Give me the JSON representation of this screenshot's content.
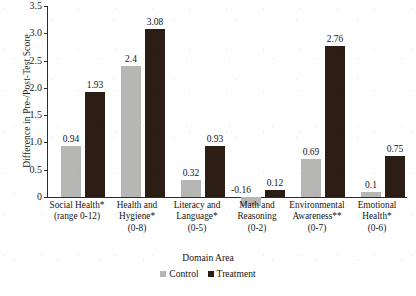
{
  "chart_data": {
    "type": "bar",
    "title": "",
    "xlabel": "Domain Area",
    "ylabel": "Difference in Pre-/Post-Test Score",
    "ylim": [
      -0.5,
      3.5
    ],
    "ytick_labels": [
      "3.5",
      "3.0",
      "2.5",
      "2.0",
      "1.5",
      "1.0",
      "0.5",
      "0"
    ],
    "ytick_values": [
      3.5,
      3.0,
      2.5,
      2.0,
      1.5,
      1.0,
      0.5,
      0
    ],
    "grid": false,
    "legend_position": "bottom-center",
    "categories": [
      "Social Health*\n(range 0-12)",
      "Health and\nHygiene*\n(0-8)",
      "Literacy and\nLanguage*\n(0-5)",
      "Math and\nReasoning\n(0-2)",
      "Environmental\nAwareness**\n(0-7)",
      "Emotional\nHealth*\n(0-6)"
    ],
    "category_lines": [
      [
        "Social Health*",
        "(range 0-12)"
      ],
      [
        "Health and",
        "Hygiene*",
        "(0-8)"
      ],
      [
        "Literacy and",
        "Language*",
        "(0-5)"
      ],
      [
        "Math and",
        "Reasoning",
        "(0-2)"
      ],
      [
        "Environmental",
        "Awareness**",
        "(0-7)"
      ],
      [
        "Emotional",
        "Health*",
        "(0-6)"
      ]
    ],
    "series": [
      {
        "name": "Control",
        "color": "#b6b6b4",
        "values": [
          0.94,
          2.4,
          0.32,
          -0.16,
          0.69,
          0.1
        ],
        "labels": [
          "0.94",
          "2.4",
          "0.32",
          "-0.16",
          "0.69",
          "0.1"
        ]
      },
      {
        "name": "Treatment",
        "color": "#2c1d15",
        "values": [
          1.93,
          3.08,
          0.93,
          0.12,
          2.76,
          0.75
        ],
        "labels": [
          "1.93",
          "3.08",
          "0.93",
          "0.12",
          "2.76",
          "0.75"
        ]
      }
    ]
  }
}
